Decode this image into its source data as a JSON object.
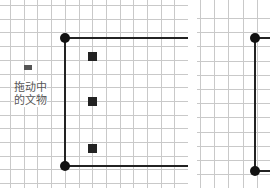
{
  "left_panel": {
    "drag_label_line1": "拖动中",
    "drag_label_line2": "的文物"
  },
  "colors": {
    "grid": "#c9c9c9",
    "line": "#222222",
    "dot": "#111111",
    "label": "#555555"
  }
}
